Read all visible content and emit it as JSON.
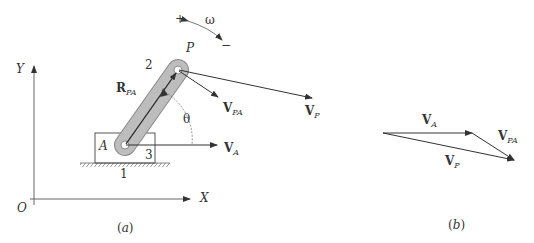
{
  "figure_a": {
    "caption": "(a)",
    "axis_y_label": "Y",
    "axis_x_label": "X",
    "origin_label": "O",
    "link_number": "2",
    "block_number": "3",
    "ground_number": "1",
    "point_a_label": "A",
    "point_p_label": "P",
    "angle_label": "θ",
    "omega_label": "ω",
    "omega_plus": "+",
    "omega_minus": "−",
    "r_pa": {
      "main": "R",
      "sub": "PA"
    },
    "v_pa": {
      "main": "V",
      "sub": "PA"
    },
    "v_p": {
      "main": "V",
      "sub": "P"
    },
    "v_a": {
      "main": "V",
      "sub": "A"
    }
  },
  "figure_b": {
    "caption": "(b)",
    "v_a": {
      "main": "V",
      "sub": "A"
    },
    "v_pa": {
      "main": "V",
      "sub": "PA"
    },
    "v_p": {
      "main": "V",
      "sub": "P"
    }
  },
  "colors": {
    "line": "#333333",
    "link_fill": "#b8b8b8",
    "link_stroke": "#888888"
  }
}
